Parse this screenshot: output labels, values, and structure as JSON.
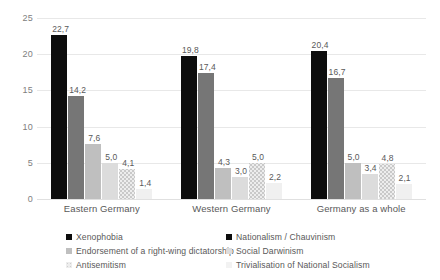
{
  "chart_data": {
    "type": "bar",
    "title": "",
    "subtitle": "",
    "xlabel": "",
    "ylabel": "",
    "ylim": [
      0,
      25
    ],
    "yticks": [
      "0",
      "5",
      "10",
      "15",
      "20",
      "25"
    ],
    "ytick_values": [
      0,
      5,
      10,
      15,
      20,
      25
    ],
    "grid": true,
    "grid_axis": "y",
    "legend_position": "bottom",
    "decimal_separator": ",",
    "categories": [
      "Eastern Germany",
      "Western Germany",
      "Germany as a whole"
    ],
    "series": [
      {
        "name": "Xenophobia",
        "color": "#0d0d0d",
        "values": [
          22.7,
          19.8,
          20.4
        ],
        "labels": [
          "22,7",
          "19,8",
          "20,4"
        ]
      },
      {
        "name": "Nationalism / Chauvinism",
        "color": "#767676",
        "values": [
          14.2,
          17.4,
          16.7
        ],
        "labels": [
          "14,2",
          "17,4",
          "16,7"
        ]
      },
      {
        "name": "Endorsement of a right-wing dictatorship",
        "color": "#bfbfbf",
        "values": [
          7.6,
          4.3,
          5.0
        ],
        "labels": [
          "7,6",
          "4,3",
          "5,0"
        ]
      },
      {
        "name": "Social Darwinism",
        "color": "#dcdcdc",
        "values": [
          5.0,
          3.0,
          3.4
        ],
        "labels": [
          "5,0",
          "3,0",
          "3,4"
        ]
      },
      {
        "name": "Antisemitism",
        "color": "#ededed",
        "values": [
          4.1,
          5.0,
          4.8
        ],
        "labels": [
          "4,1",
          "5,0",
          "4,8"
        ]
      },
      {
        "name": "Trivialisation of National Socialism",
        "color": "#f0f0f0",
        "values": [
          1.4,
          2.2,
          2.1
        ],
        "labels": [
          "1,4",
          "2,2",
          "2,1"
        ]
      }
    ]
  },
  "axis": {
    "y": {
      "ticks": [
        "25",
        "20",
        "15",
        "10",
        "5",
        "0"
      ]
    },
    "x": {
      "categories": [
        "Eastern Germany",
        "Western Germany",
        "Germany as a whole"
      ]
    }
  },
  "legend": {
    "entries": [
      "Xenophobia",
      "Nationalism / Chauvinism",
      "Endorsement of a right-wing dictatorship",
      "Social Darwinism",
      "Antisemitism",
      "Trivialisation of National Socialism"
    ]
  },
  "values": {
    "g0": [
      "22,7",
      "14,2",
      "7,6",
      "5,0",
      "4,1",
      "1,4"
    ],
    "g1": [
      "19,8",
      "17,4",
      "4,3",
      "3,0",
      "5,0",
      "2,2"
    ],
    "g2": [
      "20,4",
      "16,7",
      "5,0",
      "3,4",
      "4,8",
      "2,1"
    ]
  }
}
